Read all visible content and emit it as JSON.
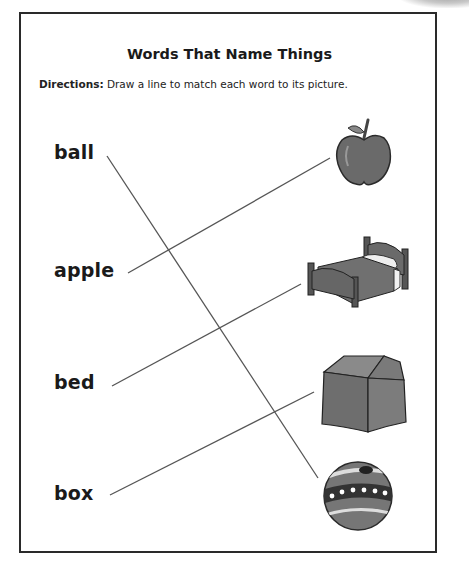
{
  "worksheet": {
    "title": "Words That Name Things",
    "directions_label": "Directions:",
    "directions_text": " Draw a line to match each word to its picture."
  },
  "words": [
    {
      "label": "ball"
    },
    {
      "label": "apple"
    },
    {
      "label": "bed"
    },
    {
      "label": "box"
    }
  ],
  "pictures": [
    {
      "icon": "apple-icon"
    },
    {
      "icon": "bed-icon"
    },
    {
      "icon": "box-icon"
    },
    {
      "icon": "ball-icon"
    }
  ],
  "matches": [
    {
      "word": "ball",
      "picture": "ball"
    },
    {
      "word": "apple",
      "picture": "apple"
    },
    {
      "word": "bed",
      "picture": "bed"
    },
    {
      "word": "box",
      "picture": "box"
    }
  ],
  "colors": {
    "border": "#2a2a2a",
    "text": "#1a1a1a",
    "line": "#555555",
    "picture_fill": "#6e6e6e"
  }
}
